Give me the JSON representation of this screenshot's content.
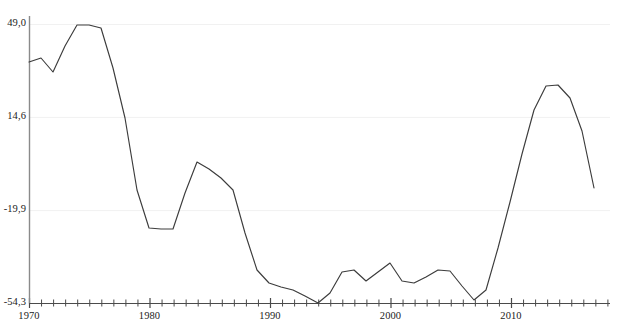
{
  "chart_data": {
    "type": "line",
    "title": "",
    "subtitle": "",
    "xlabel": "",
    "ylabel": "",
    "grid": true,
    "legend": "none",
    "xlim": [
      1969.3,
      2019.2
    ],
    "ylim": [
      -54.3,
      49.0
    ],
    "y_ticks": [
      {
        "value": 49.0,
        "label": "49,0"
      },
      {
        "value": 14.6,
        "label": "14,6"
      },
      {
        "value": -19.9,
        "label": "-19,9"
      },
      {
        "value": -54.3,
        "label": "-54,3"
      }
    ],
    "x_ticks_major": [
      {
        "value": 1970,
        "label": "1970"
      },
      {
        "value": 1980,
        "label": "1980"
      },
      {
        "value": 1990,
        "label": "1990"
      },
      {
        "value": 2000,
        "label": "2000"
      },
      {
        "value": 2010,
        "label": "2010"
      }
    ],
    "x_tick_minor_step": 1,
    "x_tick_minor_start": 1970,
    "x_tick_minor_end": 2018,
    "line_color": "#3c3c3c",
    "axis_color": "#8a8a8a",
    "grid_color": "#f1f1f1",
    "x": [
      1970,
      1971,
      1972,
      1973,
      1974,
      1975,
      1976,
      1977,
      1978,
      1979,
      1980,
      1981,
      1982,
      1983,
      1984,
      1985,
      1986,
      1987,
      1988,
      1989,
      1990,
      1991,
      1992,
      1993,
      1994,
      1995,
      1996,
      1997,
      1998,
      1999,
      2000,
      2001,
      2002,
      2003,
      2004,
      2005,
      2006,
      2007,
      2008,
      2009,
      2010,
      2011,
      2012,
      2013,
      2014,
      2015,
      2016,
      2017
    ],
    "values": [
      35.1,
      36.6,
      31.4,
      40.9,
      49.0,
      49.0,
      47.5,
      37.0,
      18.0,
      -2.4,
      -23.5,
      -24.0,
      -24.0,
      -10.0,
      0.4,
      -2.6,
      -5.5,
      -8.7,
      -20.0,
      -31.9,
      -36.4,
      -38.0,
      -39.0,
      -43.0,
      -54.3,
      -50.5,
      -42.6,
      -41.9,
      -45.9,
      -42.6,
      -39.3,
      -45.9,
      -46.6,
      -44.4,
      -41.9,
      -42.3,
      -47.8,
      -53.0,
      -49.5,
      -34.0,
      -17.0,
      1.0,
      17.0,
      25.9,
      26.3,
      21.5,
      9.0,
      -5.0
    ],
    "points_px": [
      [
        29,
        62
      ],
      [
        41,
        58
      ],
      [
        53,
        72
      ],
      [
        65,
        46
      ],
      [
        77,
        25
      ],
      [
        89,
        25
      ],
      [
        101,
        28
      ],
      [
        113,
        68
      ],
      [
        125,
        118
      ],
      [
        137,
        190
      ],
      [
        149,
        228
      ],
      [
        161,
        229
      ],
      [
        173,
        229
      ],
      [
        185,
        193
      ],
      [
        197,
        162
      ],
      [
        209,
        169
      ],
      [
        221,
        178
      ],
      [
        233,
        190
      ],
      [
        245,
        233
      ],
      [
        257,
        270
      ],
      [
        269,
        283
      ],
      [
        281,
        287
      ],
      [
        293,
        290
      ],
      [
        305,
        296
      ],
      [
        318,
        303
      ],
      [
        330,
        293
      ],
      [
        342,
        272
      ],
      [
        354,
        270
      ],
      [
        366,
        281
      ],
      [
        378,
        272
      ],
      [
        390,
        263
      ],
      [
        402,
        281
      ],
      [
        414,
        283
      ],
      [
        426,
        277
      ],
      [
        438,
        270
      ],
      [
        450,
        271
      ],
      [
        462,
        286
      ],
      [
        474,
        300
      ],
      [
        486,
        290
      ],
      [
        498,
        248
      ],
      [
        510,
        202
      ],
      [
        522,
        154
      ],
      [
        534,
        110
      ],
      [
        546,
        86
      ],
      [
        558,
        85
      ],
      [
        570,
        98
      ],
      [
        582,
        131
      ],
      [
        594,
        188
      ]
    ]
  },
  "axes": {
    "y_axis_x_px": 29,
    "x_axis_y_px": 303,
    "x_axis_end_px": 610,
    "y_axis_top_px": 24,
    "px_per_year": 12.05,
    "px_per_unit": 2.7
  }
}
